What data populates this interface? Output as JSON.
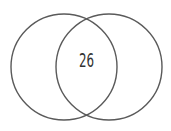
{
  "diagram": {
    "type": "venn",
    "sets": [
      {
        "name": "left-set",
        "cx": 64,
        "cy": 67,
        "r": 53
      },
      {
        "name": "right-set",
        "cx": 109,
        "cy": 67,
        "r": 53
      }
    ],
    "intersection_label": "26",
    "stroke_color": "#5a5a5a",
    "text_color": "#333333"
  }
}
